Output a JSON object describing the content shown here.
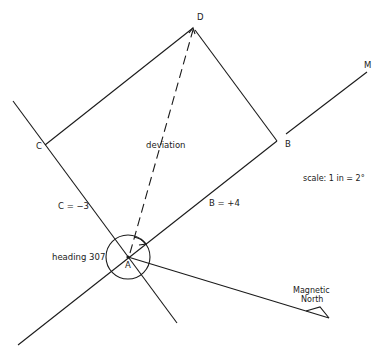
{
  "diagram": {
    "points": {
      "A": "A",
      "B": "B",
      "C": "C",
      "D": "D",
      "M": "M"
    },
    "labels": {
      "deviation": "deviation",
      "c_value": "C = −3",
      "b_value": "B = +4",
      "heading": "heading 307",
      "scale": "scale: 1 in = 2°",
      "magnetic_north_line1": "Magnetic",
      "magnetic_north_line2": "North"
    },
    "colors": {
      "line": "#1a1a1a",
      "background": "#ffffff"
    }
  }
}
